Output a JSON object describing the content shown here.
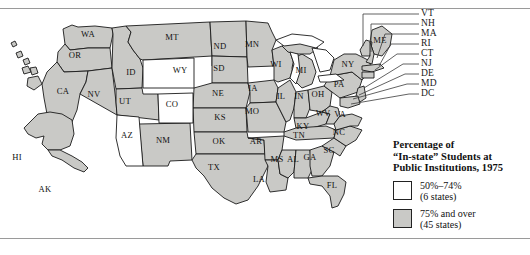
{
  "figure": {
    "type": "choropleth-map",
    "region": "United States",
    "title": "Percentage of “In-state” Students at Public Institutions, 1975"
  },
  "legend": {
    "title_lines": [
      "Percentage of",
      "“In-state” Students at",
      "Public Institutions, 1975"
    ],
    "entries": [
      {
        "range": "50%–74%",
        "count": "(6 states)",
        "color": "#ffffff"
      },
      {
        "range": "75% and over",
        "count": "(45 states)",
        "color": "#c9c9c6"
      }
    ]
  },
  "map": {
    "fill_low": "#ffffff",
    "fill_high": "#c9c9c6",
    "stroke": "#1a1a1a",
    "water": "#ffffff",
    "state_labels": [
      {
        "id": "WA",
        "x": 88,
        "y": 27
      },
      {
        "id": "OR",
        "x": 75,
        "y": 48
      },
      {
        "id": "CA",
        "x": 63,
        "y": 84
      },
      {
        "id": "NV",
        "x": 94,
        "y": 87
      },
      {
        "id": "ID",
        "x": 131,
        "y": 65
      },
      {
        "id": "MT",
        "x": 172,
        "y": 30
      },
      {
        "id": "WY",
        "x": 180,
        "y": 63
      },
      {
        "id": "UT",
        "x": 125,
        "y": 94
      },
      {
        "id": "AZ",
        "x": 127,
        "y": 128
      },
      {
        "id": "CO",
        "x": 172,
        "y": 97
      },
      {
        "id": "NM",
        "x": 163,
        "y": 133
      },
      {
        "id": "ND",
        "x": 220,
        "y": 39
      },
      {
        "id": "SD",
        "x": 219,
        "y": 61
      },
      {
        "id": "NE",
        "x": 218,
        "y": 86
      },
      {
        "id": "KS",
        "x": 220,
        "y": 110
      },
      {
        "id": "OK",
        "x": 219,
        "y": 134
      },
      {
        "id": "TX",
        "x": 214,
        "y": 160
      },
      {
        "id": "MN",
        "x": 252,
        "y": 37
      },
      {
        "id": "IA",
        "x": 253,
        "y": 81
      },
      {
        "id": "MO",
        "x": 252,
        "y": 104
      },
      {
        "id": "AR",
        "x": 256,
        "y": 134
      },
      {
        "id": "LA",
        "x": 259,
        "y": 172
      },
      {
        "id": "WI",
        "x": 276,
        "y": 57
      },
      {
        "id": "IL",
        "x": 281,
        "y": 89
      },
      {
        "id": "MS",
        "x": 277,
        "y": 152
      },
      {
        "id": "MI",
        "x": 301,
        "y": 63
      },
      {
        "id": "IN",
        "x": 299,
        "y": 89
      },
      {
        "id": "AL",
        "x": 293,
        "y": 152
      },
      {
        "id": "OH",
        "x": 318,
        "y": 87
      },
      {
        "id": "KY",
        "x": 303,
        "y": 119
      },
      {
        "id": "TN",
        "x": 299,
        "y": 128
      },
      {
        "id": "GA",
        "x": 310,
        "y": 150
      },
      {
        "id": "FL",
        "x": 332,
        "y": 178
      },
      {
        "id": "SC",
        "x": 329,
        "y": 143
      },
      {
        "id": "NC",
        "x": 339,
        "y": 125
      },
      {
        "id": "WV",
        "x": 323,
        "y": 106
      },
      {
        "id": "VA",
        "x": 340,
        "y": 107
      },
      {
        "id": "PA",
        "x": 339,
        "y": 77
      },
      {
        "id": "NY",
        "x": 348,
        "y": 57
      },
      {
        "id": "ME",
        "x": 380,
        "y": 33
      },
      {
        "id": "HI",
        "x": 17,
        "y": 150
      },
      {
        "id": "AK",
        "x": 45,
        "y": 182
      }
    ],
    "low_states": [
      "WY",
      "CO",
      "AZ"
    ]
  },
  "callouts": [
    {
      "id": "VT",
      "label": "VT",
      "y": 14
    },
    {
      "id": "NH",
      "label": "NH",
      "y": 24
    },
    {
      "id": "MA",
      "label": "MA",
      "y": 34
    },
    {
      "id": "RI",
      "label": "RI",
      "y": 44
    },
    {
      "id": "CT",
      "label": "CT",
      "y": 54
    },
    {
      "id": "NJ",
      "label": "NJ",
      "y": 64
    },
    {
      "id": "DE",
      "label": "DE",
      "y": 74
    },
    {
      "id": "MD",
      "label": "MD",
      "y": 84
    },
    {
      "id": "DC",
      "label": "DC",
      "y": 94
    }
  ]
}
